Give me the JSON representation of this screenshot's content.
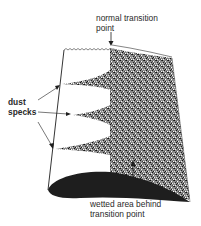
{
  "labels": {
    "transition_line1": "normal transition",
    "transition_line2": "point",
    "dust_line1": "dust",
    "dust_line2": "specks",
    "wetted_line1": "wetted area behind",
    "wetted_line2": "transition point"
  },
  "colors": {
    "ink": "#1e1e1e",
    "stipple_dark": "#2b2b2b",
    "stipple_light": "#9a9a9a",
    "background": "#ffffff"
  }
}
